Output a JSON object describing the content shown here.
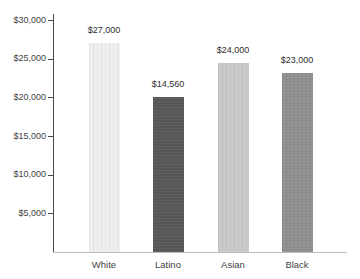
{
  "chart_data": {
    "type": "bar",
    "title": "",
    "categories": [
      "White",
      "Latino",
      "Asian",
      "Black"
    ],
    "values": [
      27000,
      14560,
      24000,
      23000
    ],
    "value_labels": [
      "$27,000",
      "$14,560",
      "$24,000",
      "$23,000"
    ],
    "drawn_values": [
      27000,
      20000,
      24400,
      23200
    ],
    "bar_colors": [
      "#efefef",
      "#575757",
      "#c9c9c9",
      "#8f8f8f"
    ],
    "y_axis": {
      "tick_values": [
        30000,
        25000,
        20000,
        15000,
        10000,
        5000
      ],
      "tick_labels": [
        "$30,000",
        "$25,000",
        "$20,000",
        "$15,000",
        "$10,000",
        "$5,000"
      ],
      "range": [
        0,
        30000
      ]
    },
    "xlabel": "",
    "ylabel": "",
    "grid": false,
    "legend": "none",
    "note": "The Latino bar is drawn up to the $20,000 gridline even though its data label reads $14,560."
  },
  "colors": {
    "background": "#ffffff",
    "y_axis_line": "#4a4a4a",
    "x_axis_line": "#bcbcbc",
    "text": "#3f3f3f"
  }
}
